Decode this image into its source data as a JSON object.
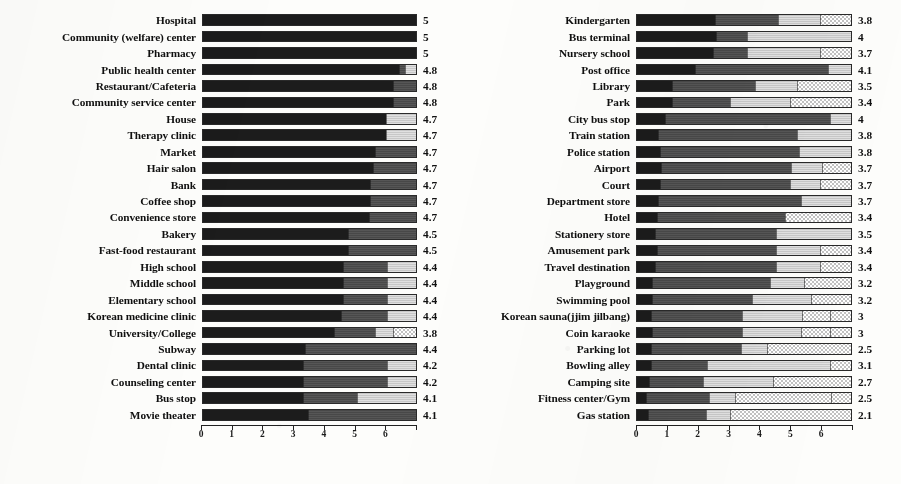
{
  "chart_data": {
    "type": "bar",
    "subtype": "stacked-horizontal-100pct",
    "title": "",
    "xlabel": "",
    "ylabel": "",
    "xlim": [
      0,
      7
    ],
    "xticks": [
      0,
      1,
      2,
      3,
      4,
      5,
      6,
      7
    ],
    "grid": false,
    "legend": "none",
    "series": [
      {
        "name": "segment-1",
        "color": "#1c1c1c"
      },
      {
        "name": "segment-2",
        "color": "#4d4d4d"
      },
      {
        "name": "segment-3",
        "color": "#cfcfcf"
      },
      {
        "name": "segment-4",
        "color": "#ffffff"
      }
    ],
    "panels": [
      {
        "name": "left-panel",
        "categories": [
          "Hospital",
          "Community (welfare) center",
          "Pharmacy",
          "Public health center",
          "Restaurant/Cafeteria",
          "Community service center",
          "House",
          "Therapy clinic",
          "Market",
          "Hair salon",
          "Bank",
          "Coffee shop",
          "Convenience store",
          "Bakery",
          "Fast-food restaurant",
          "High school",
          "Middle school",
          "Elementary school",
          "Korean medicine clinic",
          "University/College",
          "Subway",
          "Dental clinic",
          "Counseling center",
          "Bus stop",
          "Movie theater"
        ],
        "values": [
          5,
          5,
          5,
          4.8,
          4.8,
          4.8,
          4.7,
          4.7,
          4.7,
          4.7,
          4.7,
          4.7,
          4.7,
          4.5,
          4.5,
          4.4,
          4.4,
          4.4,
          4.4,
          3.8,
          4.4,
          4.2,
          4.2,
          4.1,
          4.1
        ],
        "value_labels": [
          "5",
          "5",
          "5",
          "4.8",
          "4.8",
          "4.8",
          "4.7",
          "4.7",
          "4.7",
          "4.7",
          "4.7",
          "4.7",
          "4.7",
          "4.5",
          "4.5",
          "4.4",
          "4.4",
          "4.4",
          "4.4",
          "3.8",
          "4.4",
          "4.2",
          "4.2",
          "4.1",
          "4.1"
        ],
        "stacks": [
          [
            7.0,
            0.0,
            0.0,
            0.0
          ],
          [
            7.0,
            0.0,
            0.0,
            0.0
          ],
          [
            7.0,
            0.0,
            0.0,
            0.0
          ],
          [
            6.45,
            0.2,
            0.35,
            0.0
          ],
          [
            6.25,
            0.75,
            0.0,
            0.0
          ],
          [
            6.25,
            0.75,
            0.0,
            0.0
          ],
          [
            6.0,
            0.0,
            1.0,
            0.0
          ],
          [
            6.0,
            0.0,
            1.0,
            0.0
          ],
          [
            5.65,
            1.35,
            0.0,
            0.0
          ],
          [
            5.6,
            1.4,
            0.0,
            0.0
          ],
          [
            5.5,
            1.5,
            0.0,
            0.0
          ],
          [
            5.5,
            1.5,
            0.0,
            0.0
          ],
          [
            5.45,
            1.55,
            0.0,
            0.0
          ],
          [
            4.75,
            2.25,
            0.0,
            0.0
          ],
          [
            4.75,
            2.25,
            0.0,
            0.0
          ],
          [
            4.6,
            1.45,
            0.95,
            0.0
          ],
          [
            4.6,
            1.45,
            0.95,
            0.0
          ],
          [
            4.6,
            1.45,
            0.95,
            0.0
          ],
          [
            4.55,
            1.5,
            0.95,
            0.0
          ],
          [
            4.3,
            1.35,
            0.6,
            0.75
          ],
          [
            3.35,
            3.65,
            0.0,
            0.0
          ],
          [
            3.3,
            2.75,
            0.95,
            0.0
          ],
          [
            3.3,
            2.75,
            0.95,
            0.0
          ],
          [
            3.3,
            1.75,
            1.95,
            0.0
          ],
          [
            3.45,
            3.55,
            0.0,
            0.0
          ]
        ]
      },
      {
        "name": "right-panel",
        "categories": [
          "Kindergarten",
          "Bus terminal",
          "Nursery school",
          "Post office",
          "Library",
          "Park",
          "City bus stop",
          "Train station",
          "Police station",
          "Airport",
          "Court",
          "Department store",
          "Hotel",
          "Stationery store",
          "Amusement park",
          "Travel destination",
          "Playground",
          "Swimming pool",
          "Korean sauna(jjim jilbang)",
          "Coin karaoke",
          "Parking lot",
          "Bowling alley",
          "Camping site",
          "Fitness center/Gym",
          "Gas station"
        ],
        "values": [
          3.8,
          4,
          3.7,
          4.1,
          3.5,
          3.4,
          4,
          3.8,
          3.8,
          3.7,
          3.7,
          3.7,
          3.4,
          3.5,
          3.4,
          3.4,
          3.2,
          3.2,
          3,
          3,
          2.5,
          3.1,
          2.7,
          2.5,
          2.1
        ],
        "value_labels": [
          "3.8",
          "4",
          "3.7",
          "4.1",
          "3.5",
          "3.4",
          "4",
          "3.8",
          "3.8",
          "3.7",
          "3.7",
          "3.7",
          "3.4",
          "3.5",
          "3.4",
          "3.4",
          "3.2",
          "3.2",
          "3",
          "3",
          "2.5",
          "3.1",
          "2.7",
          "2.5",
          "2.1"
        ],
        "stacks": [
          [
            2.55,
            2.05,
            1.4,
            1.0
          ],
          [
            2.6,
            1.0,
            3.4,
            0.0
          ],
          [
            2.5,
            1.1,
            2.4,
            1.0
          ],
          [
            1.9,
            4.35,
            0.75,
            0.0
          ],
          [
            1.15,
            2.7,
            1.4,
            1.75
          ],
          [
            1.15,
            1.9,
            1.95,
            2.0
          ],
          [
            0.9,
            5.4,
            0.7,
            0.0
          ],
          [
            0.7,
            4.55,
            1.75,
            0.0
          ],
          [
            0.75,
            4.55,
            1.7,
            0.0
          ],
          [
            0.8,
            4.25,
            1.0,
            0.95
          ],
          [
            0.75,
            4.25,
            1.0,
            1.0
          ],
          [
            0.7,
            4.65,
            1.65,
            0.0
          ],
          [
            0.65,
            4.2,
            0.0,
            2.15
          ],
          [
            0.6,
            3.95,
            2.45,
            0.0
          ],
          [
            0.65,
            3.9,
            1.45,
            1.0
          ],
          [
            0.6,
            3.95,
            1.45,
            1.0
          ],
          [
            0.5,
            3.85,
            1.1,
            1.55
          ],
          [
            0.5,
            3.25,
            1.95,
            1.3
          ],
          [
            0.45,
            3.0,
            1.95,
            0.9,
            0.7
          ],
          [
            0.5,
            2.95,
            1.9,
            0.95,
            0.7
          ],
          [
            0.45,
            2.95,
            0.85,
            2.75
          ],
          [
            0.45,
            1.85,
            4.0,
            0.7
          ],
          [
            0.4,
            1.75,
            2.3,
            2.55
          ],
          [
            0.3,
            2.05,
            0.85,
            3.15,
            0.65
          ],
          [
            0.35,
            1.9,
            0.8,
            3.95
          ]
        ]
      }
    ]
  }
}
